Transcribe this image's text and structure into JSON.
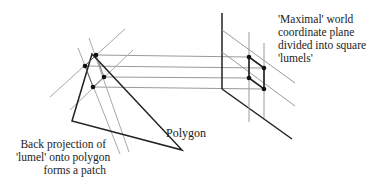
{
  "labels": {
    "plane": "'Maximal' world\ncoordinate plane\ndivided into square\n'lumels'",
    "polygon": "Polygon",
    "patch": "Back projection of\n'lumel' onto polygon\nforms a patch"
  },
  "colors": {
    "thick": "#222222",
    "thin": "#9a9a9a",
    "dot": "#111111"
  }
}
